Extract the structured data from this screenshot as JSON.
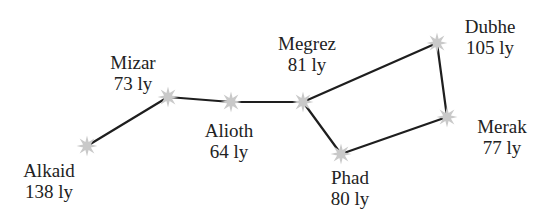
{
  "diagram": {
    "colors": {
      "line": "#1e1e1e",
      "star": "#c9c9c9",
      "text": "#222222",
      "background": "#ffffff"
    },
    "stars": [
      {
        "id": "alkaid",
        "name": "Alkaid",
        "distance": "138 ly",
        "x": 87,
        "y": 146,
        "label_x": 49,
        "label_y": 160
      },
      {
        "id": "mizar",
        "name": "Mizar",
        "distance": "73 ly",
        "x": 168,
        "y": 97,
        "label_x": 133,
        "label_y": 52
      },
      {
        "id": "alioth",
        "name": "Alioth",
        "distance": "64 ly",
        "x": 231,
        "y": 102,
        "label_x": 229,
        "label_y": 120
      },
      {
        "id": "megrez",
        "name": "Megrez",
        "distance": "81 ly",
        "x": 303,
        "y": 102,
        "label_x": 307,
        "label_y": 33
      },
      {
        "id": "phad",
        "name": "Phad",
        "distance": "80 ly",
        "x": 341,
        "y": 154,
        "label_x": 350,
        "label_y": 167
      },
      {
        "id": "merak",
        "name": "Merak",
        "distance": "77 ly",
        "x": 447,
        "y": 117,
        "label_x": 502,
        "label_y": 116
      },
      {
        "id": "dubhe",
        "name": "Dubhe",
        "distance": "105 ly",
        "x": 437,
        "y": 43,
        "label_x": 490,
        "label_y": 16
      }
    ],
    "connections": [
      [
        "alkaid",
        "mizar"
      ],
      [
        "mizar",
        "alioth"
      ],
      [
        "alioth",
        "megrez"
      ],
      [
        "megrez",
        "dubhe"
      ],
      [
        "dubhe",
        "merak"
      ],
      [
        "merak",
        "phad"
      ],
      [
        "phad",
        "megrez"
      ]
    ]
  }
}
